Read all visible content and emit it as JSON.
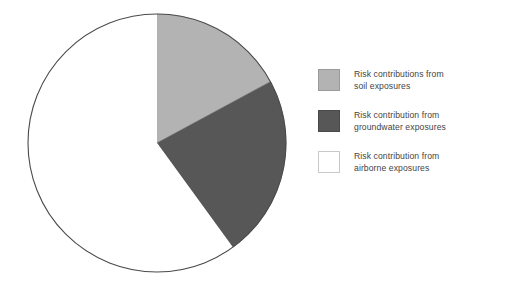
{
  "figure": {
    "background_color": "#ffffff"
  },
  "chart_data": {
    "type": "pie",
    "title": "",
    "subtitle": "",
    "xlabel": "",
    "ylabel": "",
    "grid": false,
    "legend_position": "right",
    "start_angle_deg": 0,
    "direction": "clockwise",
    "center": {
      "x": 157,
      "y": 143
    },
    "radius": 129,
    "outline_color": "#4a4a4a",
    "labels": [
      "Risk contributions from soil exposures",
      "Risk contribution from groundwater exposures",
      "Risk contribution from airborne exposures"
    ],
    "values": [
      17,
      23,
      60
    ],
    "value_unit": "percent",
    "slice_angles_deg": [
      61.6,
      82.4,
      216.0
    ],
    "slice_bounds_deg": [
      [
        0,
        61.6
      ],
      [
        61.6,
        144.0
      ],
      [
        144.0,
        360.0
      ]
    ],
    "colors": [
      "#b3b3b3",
      "#575757",
      "#ffffff"
    ],
    "annotations": []
  },
  "legend": {
    "items": [
      {
        "swatch_name": "soil-swatch",
        "color": "#b3b3b3",
        "border_color": "#9a9a9a",
        "label": "Risk contributions from\nsoil exposures"
      },
      {
        "swatch_name": "groundwater-swatch",
        "color": "#575757",
        "border_color": "#4a4a4a",
        "label": "Risk contribution from\ngroundwater exposures"
      },
      {
        "swatch_name": "airborne-swatch",
        "color": "#ffffff",
        "border_color": "#c9c9c9",
        "label": "Risk contribution from\nairborne exposures"
      }
    ]
  }
}
